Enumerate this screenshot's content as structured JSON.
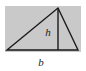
{
  "figure": {
    "name": "triangle-area-diagram",
    "kind": "geometry-diagram",
    "background_color": "#ffffff",
    "panel": {
      "name": "gray-panel",
      "fill_color": "#c9c9c9",
      "x": 5,
      "y": 6,
      "width": 76,
      "height": 46
    },
    "triangle": {
      "name": "triangle-shape",
      "stroke_color": "#1a1a1a",
      "stroke_width": 1.4,
      "fill": "none",
      "vertices": {
        "left": {
          "x": 7,
          "y": 50
        },
        "apex": {
          "x": 58,
          "y": 8
        },
        "right": {
          "x": 78,
          "y": 50
        }
      }
    },
    "height_line": {
      "name": "height-segment",
      "stroke_color": "#1a1a1a",
      "stroke_width": 1.4,
      "x1": 58,
      "y1": 8,
      "x2": 58,
      "y2": 50
    },
    "labels": {
      "height": {
        "name": "height-label",
        "text": "h",
        "x": 48,
        "y": 36,
        "color": "#1c1c1c",
        "style": "italic"
      },
      "base": {
        "name": "base-label",
        "text": "b",
        "x": 41,
        "y": 66,
        "color": "#1c1c1c",
        "style": "italic"
      }
    }
  }
}
